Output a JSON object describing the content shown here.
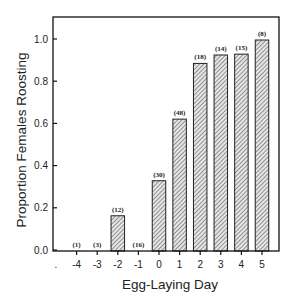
{
  "chart_data": {
    "type": "bar",
    "title": "",
    "xlabel": "Egg-Laying Day",
    "ylabel": "Proportion Females Roosting",
    "categories": [
      "-4",
      "-3",
      "-2",
      "-1",
      "0",
      "1",
      "2",
      "3",
      "4",
      "5"
    ],
    "values": [
      0.0,
      0.0,
      0.167,
      0.0,
      0.333,
      0.625,
      0.889,
      0.929,
      0.933,
      1.0
    ],
    "sample_sizes": [
      "(1)",
      "(3)",
      "(12)",
      "(16)",
      "(30)",
      "(48)",
      "(18)",
      "(14)",
      "(15)",
      "(8)"
    ],
    "yticks": [
      "0.0",
      "0.2",
      "0.4",
      "0.6",
      "0.8",
      "1.0"
    ],
    "ylim": [
      0,
      1.1
    ],
    "extra_x_tick_label": ".",
    "grid": false,
    "legend": null,
    "bar_fill": "diagonal hatch",
    "colors": {
      "axis": "#111111",
      "bar_stroke": "#222222",
      "hatch": "#555555"
    }
  }
}
